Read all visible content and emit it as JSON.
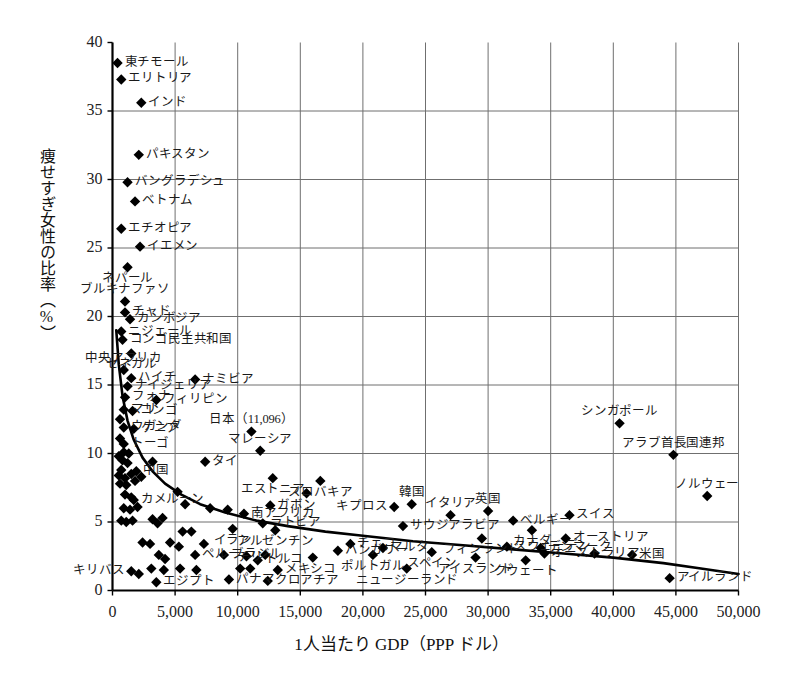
{
  "chart_data": {
    "type": "scatter",
    "title": "",
    "xlabel": "1人当たり GDP（PPP ドル）",
    "ylabel": "痩せすぎ女性の比率（%）",
    "xlim": [
      0,
      50000
    ],
    "ylim": [
      0,
      40
    ],
    "xticks": [
      "0",
      "5,000",
      "10,000",
      "15,000",
      "20,000",
      "25,000",
      "30,000",
      "35,000",
      "40,000",
      "45,000",
      "50,000"
    ],
    "xtick_values": [
      0,
      5000,
      10000,
      15000,
      20000,
      25000,
      30000,
      35000,
      40000,
      45000,
      50000
    ],
    "yticks": [
      "0",
      "5",
      "10",
      "15",
      "20",
      "25",
      "30",
      "35",
      "40"
    ],
    "ytick_values": [
      0,
      5,
      10,
      15,
      20,
      25,
      30,
      35,
      40
    ],
    "grid": true,
    "legend": "none",
    "marker": "diamond",
    "marker_color": "#000000",
    "trend_line": {
      "kind": "power-law fitted curve",
      "color": "#000000",
      "points": [
        [
          300,
          19.0
        ],
        [
          500,
          16.5
        ],
        [
          800,
          14.2
        ],
        [
          1200,
          12.4
        ],
        [
          1700,
          11.0
        ],
        [
          2400,
          9.7
        ],
        [
          3200,
          8.7
        ],
        [
          4200,
          7.8
        ],
        [
          5500,
          7.0
        ],
        [
          7000,
          6.3
        ],
        [
          9000,
          5.7
        ],
        [
          11500,
          5.1
        ],
        [
          14000,
          4.7
        ],
        [
          17000,
          4.3
        ],
        [
          20000,
          4.0
        ],
        [
          24000,
          3.6
        ],
        [
          28000,
          3.3
        ],
        [
          32000,
          3.0
        ],
        [
          36000,
          2.7
        ],
        [
          40000,
          2.4
        ],
        [
          44000,
          2.0
        ],
        [
          47000,
          1.6
        ],
        [
          50000,
          1.2
        ]
      ]
    },
    "annotations": [
      {
        "label": "日本（11,096）",
        "x": 11096,
        "y": 11.6,
        "note": "Japan value annotated inline with its GDP figure"
      }
    ],
    "points": [
      {
        "label": "東チモール",
        "x": 400,
        "y": 38.5,
        "label_pos": "right"
      },
      {
        "label": "エリトリア",
        "x": 700,
        "y": 37.3,
        "label_pos": "right"
      },
      {
        "label": "インド",
        "x": 2300,
        "y": 35.6,
        "label_pos": "right"
      },
      {
        "label": "パキスタン",
        "x": 2100,
        "y": 31.8,
        "label_pos": "right"
      },
      {
        "label": "バングラデシュ",
        "x": 1200,
        "y": 29.8,
        "label_pos": "right"
      },
      {
        "label": "ベトナム",
        "x": 1800,
        "y": 28.4,
        "label_pos": "right"
      },
      {
        "label": "エチオピア",
        "x": 700,
        "y": 26.4,
        "label_pos": "right"
      },
      {
        "label": "イエメン",
        "x": 2200,
        "y": 25.1,
        "label_pos": "right"
      },
      {
        "label": "ネパール",
        "x": 1200,
        "y": 23.6,
        "label_pos": "below"
      },
      {
        "label": "ブルキナファソ",
        "x": 1000,
        "y": 21.1,
        "label_pos": "above"
      },
      {
        "label": "チャド",
        "x": 1000,
        "y": 20.3,
        "label_pos": "right"
      },
      {
        "label": "カンボジア",
        "x": 1400,
        "y": 19.8,
        "label_pos": "right"
      },
      {
        "label": "ニジェール",
        "x": 700,
        "y": 18.9,
        "label_pos": "right"
      },
      {
        "label": "コンゴ民主共和国",
        "x": 800,
        "y": 18.3,
        "label_pos": "right"
      },
      {
        "label": "セネガル",
        "x": 1500,
        "y": 17.3,
        "label_pos": "below"
      },
      {
        "label": "中央アフリカ",
        "x": 900,
        "y": 16.1,
        "label_pos": "above"
      },
      {
        "label": "ハイチ",
        "x": 1500,
        "y": 15.5,
        "label_pos": "right"
      },
      {
        "label": "ナミビア",
        "x": 6600,
        "y": 15.4,
        "label_pos": "right"
      },
      {
        "label": "ナイジェリア",
        "x": 1200,
        "y": 14.9,
        "label_pos": "right"
      },
      {
        "label": "フォナ",
        "x": 1000,
        "y": 14.1,
        "label_pos": "right"
      },
      {
        "label": "フィリピン",
        "x": 3500,
        "y": 13.9,
        "label_pos": "right"
      },
      {
        "label": "マリ",
        "x": 900,
        "y": 13.2,
        "label_pos": "right"
      },
      {
        "label": "コンゴ",
        "x": 1600,
        "y": 13.1,
        "label_pos": "right"
      },
      {
        "label": "ウガンダ",
        "x": 900,
        "y": 11.9,
        "label_pos": "right"
      },
      {
        "label": "ケニア",
        "x": 1700,
        "y": 11.8,
        "label_pos": "right"
      },
      {
        "label": "トーゴ",
        "x": 900,
        "y": 10.7,
        "label_pos": "right"
      },
      {
        "label": "マレーシア",
        "x": 11800,
        "y": 10.2,
        "label_pos": "above"
      },
      {
        "label": "タイ",
        "x": 7400,
        "y": 9.4,
        "label_pos": "right"
      },
      {
        "label": "中国",
        "x": 1900,
        "y": 8.7,
        "label_pos": "right"
      },
      {
        "label": "エストニア",
        "x": 12800,
        "y": 8.2,
        "label_pos": "below"
      },
      {
        "label": "スロバキア",
        "x": 16600,
        "y": 8.0,
        "label_pos": "below"
      },
      {
        "label": "カメルーン",
        "x": 1700,
        "y": 6.6,
        "label_pos": "right"
      },
      {
        "label": "ガボン",
        "x": 12600,
        "y": 6.2,
        "label_pos": "right"
      },
      {
        "label": "キプロス",
        "x": 22500,
        "y": 6.1,
        "label_pos": "left"
      },
      {
        "label": "韓国",
        "x": 23900,
        "y": 6.3,
        "label_pos": "above"
      },
      {
        "label": "イタリア",
        "x": 27000,
        "y": 5.5,
        "label_pos": "above"
      },
      {
        "label": "英国",
        "x": 30000,
        "y": 5.8,
        "label_pos": "above"
      },
      {
        "label": "ベルギー",
        "x": 32000,
        "y": 5.1,
        "label_pos": "right"
      },
      {
        "label": "スイス",
        "x": 36500,
        "y": 5.5,
        "label_pos": "right"
      },
      {
        "label": "南アフリカ",
        "x": 10500,
        "y": 5.6,
        "label_pos": "right"
      },
      {
        "label": "ラトビア",
        "x": 12000,
        "y": 4.9,
        "label_pos": "right"
      },
      {
        "label": "サウジアラビア",
        "x": 23200,
        "y": 4.7,
        "label_pos": "right"
      },
      {
        "label": "カナダ",
        "x": 33500,
        "y": 4.4,
        "label_pos": "below"
      },
      {
        "label": "イラン",
        "x": 9600,
        "y": 4.5,
        "label_pos": "below"
      },
      {
        "label": "アルゼンチン",
        "x": 13000,
        "y": 4.4,
        "label_pos": "below"
      },
      {
        "label": "フィンランド",
        "x": 29500,
        "y": 3.8,
        "label_pos": "below"
      },
      {
        "label": "オーストリア",
        "x": 36200,
        "y": 3.8,
        "label_pos": "right"
      },
      {
        "label": "チェコ",
        "x": 19000,
        "y": 3.4,
        "label_pos": "right"
      },
      {
        "label": "ハンガリー",
        "x": 18000,
        "y": 2.9,
        "label_pos": "right"
      },
      {
        "label": "マルタ",
        "x": 21600,
        "y": 3.1,
        "label_pos": "right"
      },
      {
        "label": "スウェーデン",
        "x": 31500,
        "y": 3.2,
        "label_pos": "right"
      },
      {
        "label": "デンマーク",
        "x": 34200,
        "y": 3.1,
        "label_pos": "right"
      },
      {
        "label": "オーストラリア",
        "x": 34500,
        "y": 2.7,
        "label_pos": "right"
      },
      {
        "label": "米国",
        "x": 41500,
        "y": 2.6,
        "label_pos": "right"
      },
      {
        "label": "ポルトガル",
        "x": 20800,
        "y": 2.6,
        "label_pos": "below"
      },
      {
        "label": "スペイン",
        "x": 25500,
        "y": 2.8,
        "label_pos": "below"
      },
      {
        "label": "アイスランド",
        "x": 29000,
        "y": 2.4,
        "label_pos": "below"
      },
      {
        "label": "クウェート",
        "x": 33000,
        "y": 2.2,
        "label_pos": "below"
      },
      {
        "label": "ニュージーランド",
        "x": 23500,
        "y": 1.6,
        "label_pos": "below"
      },
      {
        "label": "ペルー",
        "x": 6600,
        "y": 2.6,
        "label_pos": "right"
      },
      {
        "label": "ブラジル",
        "x": 8900,
        "y": 2.6,
        "label_pos": "right"
      },
      {
        "label": "トルコ",
        "x": 11600,
        "y": 2.2,
        "label_pos": "right"
      },
      {
        "label": "チリ",
        "x": 11000,
        "y": 1.6,
        "label_pos": "above"
      },
      {
        "label": "メキシコ",
        "x": 13200,
        "y": 1.5,
        "label_pos": "right"
      },
      {
        "label": "クロアチア",
        "x": 12400,
        "y": 0.7,
        "label_pos": "right"
      },
      {
        "label": "キリバス",
        "x": 1500,
        "y": 1.4,
        "label_pos": "left"
      },
      {
        "label": "エジプト",
        "x": 3500,
        "y": 0.6,
        "label_pos": "right"
      },
      {
        "label": "パナマ",
        "x": 9300,
        "y": 0.8,
        "label_pos": "right"
      },
      {
        "label": "アイルランド",
        "x": 44500,
        "y": 0.9,
        "label_pos": "right"
      },
      {
        "label": "ノルウェー",
        "x": 47500,
        "y": 6.9,
        "label_pos": "above"
      },
      {
        "label": "シンガポール",
        "x": 40500,
        "y": 12.2,
        "label_pos": "above"
      },
      {
        "label": "アラブ首長国連邦",
        "x": 44800,
        "y": 9.9,
        "label_pos": "above"
      },
      {
        "label": "",
        "x": 600,
        "y": 12.5,
        "label_pos": "none"
      },
      {
        "label": "",
        "x": 600,
        "y": 11.1,
        "label_pos": "none"
      },
      {
        "label": "",
        "x": 900,
        "y": 10.1,
        "label_pos": "none"
      },
      {
        "label": "",
        "x": 1300,
        "y": 10.0,
        "label_pos": "none"
      },
      {
        "label": "",
        "x": 500,
        "y": 9.8,
        "label_pos": "none"
      },
      {
        "label": "",
        "x": 800,
        "y": 9.5,
        "label_pos": "none"
      },
      {
        "label": "",
        "x": 1200,
        "y": 9.3,
        "label_pos": "none"
      },
      {
        "label": "",
        "x": 3200,
        "y": 9.4,
        "label_pos": "none"
      },
      {
        "label": "",
        "x": 700,
        "y": 8.8,
        "label_pos": "none"
      },
      {
        "label": "",
        "x": 500,
        "y": 8.4,
        "label_pos": "none"
      },
      {
        "label": "",
        "x": 1000,
        "y": 8.2,
        "label_pos": "none"
      },
      {
        "label": "",
        "x": 1500,
        "y": 8.5,
        "label_pos": "none"
      },
      {
        "label": "",
        "x": 600,
        "y": 7.8,
        "label_pos": "none"
      },
      {
        "label": "",
        "x": 1100,
        "y": 7.7,
        "label_pos": "none"
      },
      {
        "label": "",
        "x": 1800,
        "y": 8.0,
        "label_pos": "none"
      },
      {
        "label": "",
        "x": 2300,
        "y": 8.3,
        "label_pos": "none"
      },
      {
        "label": "",
        "x": 1000,
        "y": 7.0,
        "label_pos": "none"
      },
      {
        "label": "",
        "x": 1500,
        "y": 6.8,
        "label_pos": "none"
      },
      {
        "label": "",
        "x": 5200,
        "y": 7.2,
        "label_pos": "none"
      },
      {
        "label": "",
        "x": 15500,
        "y": 7.1,
        "label_pos": "none"
      },
      {
        "label": "",
        "x": 900,
        "y": 6.0,
        "label_pos": "none"
      },
      {
        "label": "",
        "x": 1400,
        "y": 5.9,
        "label_pos": "none"
      },
      {
        "label": "",
        "x": 2000,
        "y": 6.1,
        "label_pos": "none"
      },
      {
        "label": "",
        "x": 5800,
        "y": 6.3,
        "label_pos": "none"
      },
      {
        "label": "",
        "x": 7800,
        "y": 6.0,
        "label_pos": "none"
      },
      {
        "label": "",
        "x": 9200,
        "y": 5.9,
        "label_pos": "none"
      },
      {
        "label": "",
        "x": 700,
        "y": 5.1,
        "label_pos": "none"
      },
      {
        "label": "",
        "x": 1100,
        "y": 5.0,
        "label_pos": "none"
      },
      {
        "label": "",
        "x": 1600,
        "y": 5.1,
        "label_pos": "none"
      },
      {
        "label": "",
        "x": 3200,
        "y": 5.2,
        "label_pos": "none"
      },
      {
        "label": "",
        "x": 3600,
        "y": 4.9,
        "label_pos": "none"
      },
      {
        "label": "",
        "x": 4000,
        "y": 5.3,
        "label_pos": "none"
      },
      {
        "label": "",
        "x": 5600,
        "y": 4.3,
        "label_pos": "none"
      },
      {
        "label": "",
        "x": 6300,
        "y": 4.3,
        "label_pos": "none"
      },
      {
        "label": "",
        "x": 2400,
        "y": 3.5,
        "label_pos": "none"
      },
      {
        "label": "",
        "x": 3000,
        "y": 3.4,
        "label_pos": "none"
      },
      {
        "label": "",
        "x": 4600,
        "y": 3.5,
        "label_pos": "none"
      },
      {
        "label": "",
        "x": 5300,
        "y": 3.2,
        "label_pos": "none"
      },
      {
        "label": "",
        "x": 7300,
        "y": 3.4,
        "label_pos": "none"
      },
      {
        "label": "",
        "x": 3700,
        "y": 2.6,
        "label_pos": "none"
      },
      {
        "label": "",
        "x": 4200,
        "y": 2.3,
        "label_pos": "none"
      },
      {
        "label": "",
        "x": 3100,
        "y": 1.6,
        "label_pos": "none"
      },
      {
        "label": "",
        "x": 4100,
        "y": 1.5,
        "label_pos": "none"
      },
      {
        "label": "",
        "x": 5400,
        "y": 1.6,
        "label_pos": "none"
      },
      {
        "label": "",
        "x": 6700,
        "y": 1.5,
        "label_pos": "none"
      },
      {
        "label": "",
        "x": 2100,
        "y": 1.2,
        "label_pos": "none"
      },
      {
        "label": "",
        "x": 10200,
        "y": 1.6,
        "label_pos": "none"
      },
      {
        "label": "",
        "x": 10700,
        "y": 2.5,
        "label_pos": "none"
      },
      {
        "label": "",
        "x": 12200,
        "y": 2.6,
        "label_pos": "none"
      },
      {
        "label": "",
        "x": 16000,
        "y": 2.4,
        "label_pos": "none"
      },
      {
        "label": "",
        "x": 38500,
        "y": 2.7,
        "label_pos": "none"
      },
      {
        "label": "",
        "x": 11096,
        "y": 11.6,
        "label_pos": "none"
      }
    ]
  }
}
